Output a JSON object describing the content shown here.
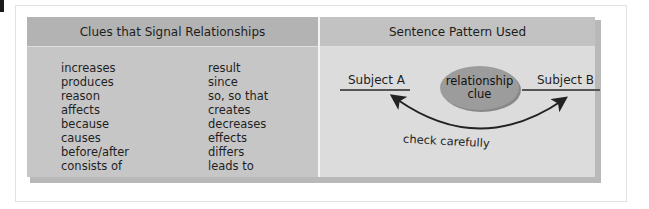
{
  "table": {
    "left_header": "Clues that Signal Relationships",
    "right_header": "Sentence Pattern Used",
    "clue_words_column_1": [
      "increases",
      "produces",
      "reason",
      "affects",
      "because",
      "causes",
      "before/after",
      "consists of"
    ],
    "clue_words_column_2": [
      "result",
      "since",
      "so, so that",
      "creates",
      "decreases",
      "effects",
      "differs",
      "leads to"
    ]
  },
  "diagram": {
    "subject_a": "Subject A",
    "subject_b": "Subject B",
    "ellipse_line1": "relationship",
    "ellipse_line2": "clue",
    "arrow_label": "check carefully"
  },
  "colors": {
    "left_header_bg": "#b3b3b3",
    "left_body_bg": "#c6c6c6",
    "right_header_bg": "#c2c2c2",
    "right_body_bg": "#dcdcdc",
    "ellipse_fill": "#9c9c9c"
  }
}
